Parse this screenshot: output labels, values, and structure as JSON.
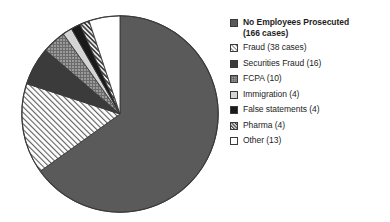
{
  "chart_data": {
    "type": "pie",
    "title": "",
    "subtitle": "",
    "xlabel": "",
    "ylabel": "",
    "total_cases": 255,
    "legend_position": "right",
    "grid": false,
    "start_angle_deg": 0,
    "direction": "clockwise",
    "categories": [
      "No Employees Prosecuted",
      "Fraud",
      "Securities Fraud",
      "FCPA",
      "Immigration",
      "False statements",
      "Pharma",
      "Other"
    ],
    "values": [
      166,
      38,
      16,
      10,
      4,
      4,
      4,
      13
    ],
    "slices": [
      {
        "label": "No Employees Prosecuted",
        "legend_label": "No Employees Prosecuted\n(166 cases)",
        "value": 166,
        "unit": "cases",
        "percent": 65.1,
        "fill": "#5a5a5a",
        "pattern": "solid",
        "bold": true
      },
      {
        "label": "Fraud",
        "legend_label": "Fraud (38 cases)",
        "value": 38,
        "unit": "cases",
        "percent": 14.9,
        "fill": "#ffffff",
        "pattern": "diagonal-hatch-light",
        "bold": false
      },
      {
        "label": "Securities Fraud",
        "legend_label": "Securities Fraud (16)",
        "value": 16,
        "unit": "cases",
        "percent": 6.3,
        "fill": "#3b3b3b",
        "pattern": "solid",
        "bold": false
      },
      {
        "label": "FCPA",
        "legend_label": "FCPA (10)",
        "value": 10,
        "unit": "cases",
        "percent": 3.9,
        "fill": "#8c8c8c",
        "pattern": "fine-grid",
        "bold": false
      },
      {
        "label": "Immigration",
        "legend_label": "Immigration (4)",
        "value": 4,
        "unit": "cases",
        "percent": 1.6,
        "fill": "#d5d5d5",
        "pattern": "solid-light",
        "bold": false
      },
      {
        "label": "False statements",
        "legend_label": "False statements (4)",
        "value": 4,
        "unit": "cases",
        "percent": 1.6,
        "fill": "#1a1a1a",
        "pattern": "solid",
        "bold": false
      },
      {
        "label": "Pharma",
        "legend_label": "Pharma (4)",
        "value": 4,
        "unit": "cases",
        "percent": 1.6,
        "fill": "#e8e8e8",
        "pattern": "diagonal-hatch-dark",
        "bold": false
      },
      {
        "label": "Other",
        "legend_label": "Other (13)",
        "value": 13,
        "unit": "cases",
        "percent": 5.1,
        "fill": "#ffffff",
        "pattern": "empty",
        "bold": false
      }
    ],
    "colors": {
      "outline": "#3a3a3a",
      "text": "#1d1d1d",
      "background": "#ffffff"
    }
  }
}
